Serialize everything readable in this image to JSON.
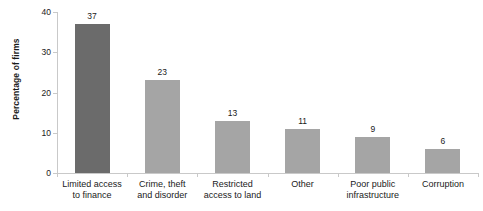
{
  "chart_data": {
    "type": "bar",
    "title": "",
    "subtitle": "",
    "xlabel": "",
    "ylabel": "Percentage of firms",
    "categories": [
      "Limited access\nto finance",
      "Crime, theft\nand disorder",
      "Restricted\naccess to land",
      "Other",
      "Poor public\ninfrastructure",
      "Corruption"
    ],
    "values": [
      37,
      23,
      13,
      11,
      9,
      6
    ],
    "data_labels": [
      "37",
      "23",
      "13",
      "11",
      "9",
      "6"
    ],
    "ylim": [
      0,
      40
    ],
    "yticks": [
      0,
      10,
      20,
      30,
      40
    ],
    "ytick_labels": [
      "0",
      "10",
      "20",
      "30",
      "40"
    ],
    "grid": false,
    "legend": "none",
    "bar_colors": [
      "#6b6b6b",
      "#a5a5a5",
      "#a5a5a5",
      "#a5a5a5",
      "#a5a5a5",
      "#a5a5a5"
    ],
    "axis_color": "#c9c9c9",
    "text_color": "#1a1a1a",
    "background": "#ffffff"
  }
}
